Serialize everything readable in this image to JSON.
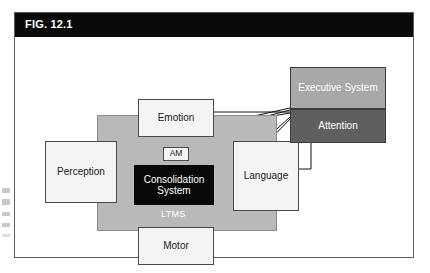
{
  "figure": {
    "label": "FIG. 12.1",
    "caption_bar_color": "#0a0a0a",
    "frame_color": "#5d5d5d"
  },
  "diagram": {
    "type": "block-diagram",
    "field": {
      "name": "LTMS",
      "label": "LTMS",
      "fill": "#b9b9b9",
      "text_color": "#ffffff"
    },
    "nodes": [
      {
        "id": "perception",
        "label": "Perception",
        "style": "white",
        "x": 30,
        "y": 104,
        "w": 72,
        "h": 62
      },
      {
        "id": "emotion",
        "label": "Emotion",
        "style": "white",
        "x": 123,
        "y": 62,
        "w": 76,
        "h": 38
      },
      {
        "id": "am",
        "label": "AM",
        "style": "am",
        "x": 148,
        "y": 110,
        "w": 26,
        "h": 14
      },
      {
        "id": "consolidation",
        "label": "Consolidation System",
        "style": "black",
        "x": 119,
        "y": 128,
        "w": 80,
        "h": 40
      },
      {
        "id": "language",
        "label": "Language",
        "style": "white",
        "x": 218,
        "y": 104,
        "w": 66,
        "h": 70
      },
      {
        "id": "motor",
        "label": "Motor",
        "style": "white",
        "x": 123,
        "y": 190,
        "w": 76,
        "h": 38
      },
      {
        "id": "executive",
        "label": "Executive System",
        "style": "exec",
        "x": 275,
        "y": 30,
        "w": 96,
        "h": 42
      },
      {
        "id": "attention",
        "label": "Attention",
        "style": "attn",
        "x": 275,
        "y": 72,
        "w": 96,
        "h": 34
      }
    ],
    "connections": [
      {
        "from": "perception",
        "to": "attention",
        "kind": "diagonal"
      },
      {
        "from": "emotion",
        "to": "attention",
        "kind": "horizontal"
      },
      {
        "from": "emotion",
        "to": "attention",
        "kind": "diagonal"
      },
      {
        "from": "consolidation",
        "to": "attention",
        "kind": "diagonal"
      },
      {
        "from": "motor",
        "to": "attention",
        "kind": "diagonal"
      },
      {
        "from": "language",
        "to": "attention",
        "kind": "vertical"
      },
      {
        "from": "language",
        "to": "attention",
        "kind": "vertical-right"
      }
    ]
  }
}
